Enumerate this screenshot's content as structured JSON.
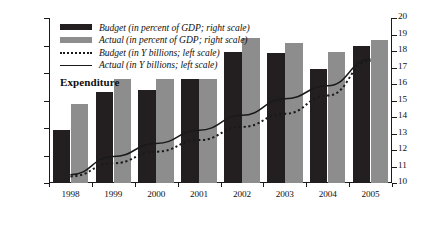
{
  "chart_data": {
    "type": "bar",
    "title": "Expenditure",
    "xlabel": "",
    "ylabel": "",
    "categories": [
      "1998",
      "1999",
      "2000",
      "2001",
      "2002",
      "2003",
      "2004",
      "2005"
    ],
    "left_axis": {
      "label": "in Y billions",
      "min": 1000,
      "max": 4000,
      "step": 500,
      "ticks": [
        "1,000",
        "1,500",
        "2,000",
        "2,500",
        "3,000",
        "3,500",
        "4,000"
      ],
      "tick_values": [
        1000,
        1500,
        2000,
        2500,
        3000,
        3500,
        4000
      ]
    },
    "right_axis": {
      "label": "in percent of GDP",
      "min": 10,
      "max": 20,
      "step": 1,
      "ticks": [
        "10",
        "11",
        "12",
        "13",
        "14",
        "15",
        "16",
        "17",
        "18",
        "19",
        "20"
      ],
      "tick_values": [
        10,
        11,
        12,
        13,
        14,
        15,
        16,
        17,
        18,
        19,
        20
      ]
    },
    "grid": false,
    "legend_position": "top-left",
    "series": [
      {
        "name": "Budget (in percent of GDP; right scale)",
        "render": "bar",
        "axis": "left",
        "color": "#231f20",
        "values": [
          1970,
          2650,
          2690,
          2900,
          3390,
          3370,
          3080,
          3490
        ]
      },
      {
        "name": "Actual (in percent of GDP; right scale)",
        "render": "bar",
        "axis": "left",
        "color": "#8d8d8d",
        "values": [
          2430,
          2900,
          2890,
          2890,
          3640,
          3550,
          3390,
          3600
        ]
      },
      {
        "name": "Budget (in Y billions; left scale)",
        "render": "dotted-line",
        "axis": "right",
        "color": "#1a1a1a",
        "values": [
          10.4,
          11.2,
          11.9,
          12.6,
          13.4,
          14.2,
          15.3,
          17.4
        ]
      },
      {
        "name": "Actual (in Y billions; left scale)",
        "render": "solid-line",
        "axis": "right",
        "color": "#1a1a1a",
        "values": [
          10.5,
          11.6,
          12.4,
          13.2,
          14.1,
          15.1,
          15.9,
          17.5
        ]
      }
    ]
  },
  "legend": {
    "items": [
      {
        "label": "Budget (in percent of GDP; right scale)",
        "swatch": "solid-dark-bar"
      },
      {
        "label": "Actual (in percent of GDP; right scale)",
        "swatch": "solid-gray-bar"
      },
      {
        "label": "Budget (in Y billions; left scale)",
        "swatch": "dotted-line"
      },
      {
        "label": "Actual (in Y billions; left scale)",
        "swatch": "solid-line"
      }
    ]
  },
  "colors": {
    "budget_bar": "#231f20",
    "actual_bar": "#8d8d8d",
    "line": "#1a1a1a",
    "axis": "#1a1a1a",
    "background": "#ffffff"
  }
}
